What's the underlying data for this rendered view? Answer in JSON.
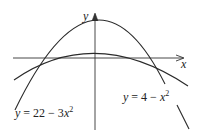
{
  "axes": {
    "x_label": "x",
    "y_label": "y"
  },
  "curves": [
    {
      "name": "tall-parabola",
      "equation": "y = 22 − 3x",
      "exp": "2",
      "prefix": "y = 22 − 3",
      "var": "x"
    },
    {
      "name": "wide-parabola",
      "equation": "y = 4 − x",
      "exp": "2",
      "prefix": "y = 4 − ",
      "var": "x"
    }
  ],
  "colors": {
    "stroke": "#2a2a2a",
    "background": "#ffffff"
  }
}
